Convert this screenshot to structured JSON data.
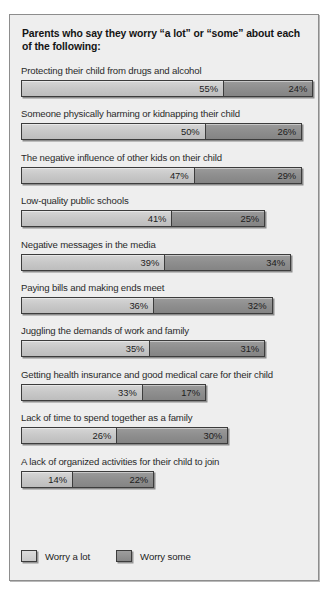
{
  "panel": {
    "title": "Parents who say they worry “a lot” or “some” about each of the following:",
    "background_color": "#eeeeee",
    "border_color": "#8d8d8d"
  },
  "legend": {
    "items": [
      {
        "label": "Worry a lot",
        "color": "#c9c9c9",
        "swatch_name": "legend-swatch-worry-a-lot"
      },
      {
        "label": "Worry some",
        "color": "#8f8f8f",
        "swatch_name": "legend-swatch-worry-some"
      }
    ]
  },
  "chart_data": {
    "type": "bar",
    "title": "Parents who say they worry “a lot” or “some” about each of the following:",
    "subtitle": "",
    "xlabel": "",
    "ylabel": "",
    "orientation": "horizontal",
    "stacked": true,
    "grid": false,
    "legend_position": "bottom-left",
    "xlim": [
      0,
      79
    ],
    "value_unit": "%",
    "categories": [
      "Protecting their child from drugs and alcohol",
      "Someone physically harming or kidnapping their child",
      "The negative influence of other kids on their child",
      "Low-quality public schools",
      "Negative messages in the media",
      "Paying bills and making ends meet",
      "Juggling the demands of work and family",
      "Getting health insurance and good medical care for their child",
      "Lack of time to spend together as a family",
      "A lack of organized activities for their child to join"
    ],
    "series": [
      {
        "name": "Worry a lot",
        "color": "#c9c9c9",
        "values": [
          55,
          50,
          47,
          41,
          39,
          36,
          35,
          33,
          26,
          14
        ],
        "labels": [
          "55%",
          "50%",
          "47%",
          "41%",
          "39%",
          "36%",
          "35%",
          "33%",
          "26%",
          "14%"
        ]
      },
      {
        "name": "Worry some",
        "color": "#8f8f8f",
        "values": [
          24,
          26,
          29,
          25,
          34,
          32,
          31,
          17,
          30,
          22
        ],
        "labels": [
          "24%",
          "26%",
          "29%",
          "25%",
          "34%",
          "32%",
          "31%",
          "17%",
          "30%",
          "22%"
        ]
      }
    ],
    "totals": [
      79,
      76,
      76,
      66,
      73,
      68,
      66,
      50,
      56,
      36
    ]
  }
}
